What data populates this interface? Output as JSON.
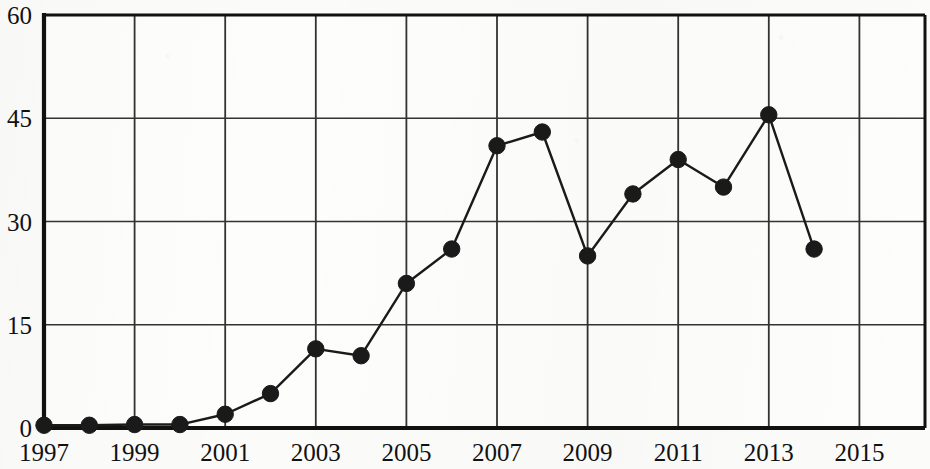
{
  "chart_data": {
    "type": "line",
    "title": "",
    "subtitle": "",
    "xlabel": "",
    "ylabel": "",
    "grid": true,
    "legend": false,
    "xlim": [
      1996.5,
      2015.5
    ],
    "ylim": [
      0,
      60
    ],
    "y_ticks": [
      0,
      15,
      30,
      45,
      60
    ],
    "y_tick_labels": [
      "0",
      "15",
      "30",
      "45",
      "60"
    ],
    "x_ticks": [
      1997,
      1999,
      2001,
      2003,
      2005,
      2007,
      2009,
      2011,
      2013,
      2015
    ],
    "x_tick_labels": [
      "1997",
      "1999",
      "2001",
      "2003",
      "2005",
      "2007",
      "2009",
      "2011",
      "2013",
      "2015"
    ],
    "marker": "filled-circle",
    "marker_color": "#1a1a1a",
    "line_color": "#1a1a1a",
    "x": [
      1997,
      1998,
      1999,
      2000,
      2001,
      2002,
      2003,
      2004,
      2005,
      2006,
      2007,
      2008,
      2009,
      2010,
      2011,
      2012,
      2013,
      2014
    ],
    "values": [
      0.4,
      0.4,
      0.5,
      0.5,
      2,
      5,
      11.5,
      10.5,
      21,
      26,
      41,
      43,
      25,
      34,
      39,
      35,
      45.5,
      26
    ],
    "series": [
      {
        "name": "",
        "x": [
          1997,
          1998,
          1999,
          2000,
          2001,
          2002,
          2003,
          2004,
          2005,
          2006,
          2007,
          2008,
          2009,
          2010,
          2011,
          2012,
          2013,
          2014
        ],
        "values": [
          0.4,
          0.4,
          0.5,
          0.5,
          2,
          5,
          11.5,
          10.5,
          21,
          26,
          41,
          43,
          25,
          34,
          39,
          35,
          45.5,
          26
        ]
      }
    ]
  },
  "colors": {
    "axis": "#111111",
    "grid": "#333333",
    "marker": "#1a1a1a",
    "background": "#fbfbfa"
  }
}
